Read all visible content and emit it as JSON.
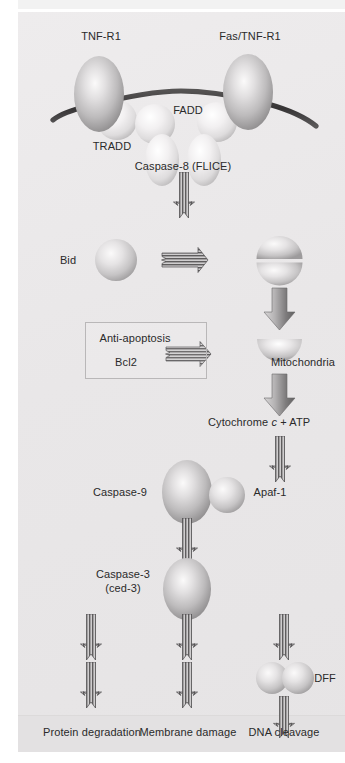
{
  "figure": {
    "background_color": "#eceaea",
    "panel_color": "#e9e7e8",
    "outcome_strip_color": "#e3e1e2"
  },
  "labels": {
    "tnf_r1": "TNF-R1",
    "fas_tnf_r1": "Fas/TNF-R1",
    "tradd": "TRADD",
    "fadd": "FADD",
    "caspase_8": "Caspase-8 (FLICE)",
    "bid": "Bid",
    "mitochondria": "Mitochondria",
    "cytochrome_prefix": "Cytochrome ",
    "cytochrome_italic": "c",
    "cytochrome_suffix": " + ATP",
    "caspase_9": "Caspase-9",
    "apaf_1": "Apaf-1",
    "caspase_3": "Caspase-3",
    "ced_3": "(ced-3)",
    "dff": "DFF",
    "anti_apoptosis": "Anti-apoptosis",
    "bcl2": "Bcl2"
  },
  "outcomes": [
    {
      "label": "Protein degradation"
    },
    {
      "label": "Membrane damage"
    },
    {
      "label": "DNA cleavage"
    }
  ],
  "colors": {
    "membrane": "#3d3d3d",
    "protein_light": "#f0eeee",
    "protein_mid": "#c9c7c8",
    "protein_dark": "#8e8c8d",
    "arrow_striped_dark": "#6f6d6e",
    "arrow_solid_dark": "#5c5a5b",
    "text": "#2a2a2a",
    "box_border": "#b9b7b8"
  },
  "pathway": {
    "nodes": [
      {
        "name": "TNF-R1",
        "shape": "ellipse",
        "role": "receptor"
      },
      {
        "name": "Fas/TNF-R1",
        "shape": "ellipse",
        "role": "receptor"
      },
      {
        "name": "TRADD",
        "shape": "sphere",
        "role": "adaptor"
      },
      {
        "name": "FADD",
        "shape": "sphere",
        "role": "adaptor"
      },
      {
        "name": "Caspase-8 (FLICE)",
        "shape": "ellipse-pair",
        "role": "initiator-caspase"
      },
      {
        "name": "Bid",
        "shape": "sphere",
        "role": "bh3-protein"
      },
      {
        "name": "Mitochondria",
        "shape": "hemisphere",
        "role": "organelle"
      },
      {
        "name": "Cytochrome c + ATP",
        "shape": "text",
        "role": "second-messenger"
      },
      {
        "name": "Caspase-9",
        "shape": "ellipse",
        "role": "initiator-caspase"
      },
      {
        "name": "Apaf-1",
        "shape": "sphere",
        "role": "adaptor"
      },
      {
        "name": "Caspase-3 (ced-3)",
        "shape": "ellipse",
        "role": "effector-caspase"
      },
      {
        "name": "DFF",
        "shape": "sphere-pair",
        "role": "nuclease-factor"
      },
      {
        "name": "Bcl2",
        "shape": "text",
        "role": "anti-apoptotic"
      }
    ],
    "edges": [
      {
        "from": "Caspase-8 (FLICE)",
        "to": "Bid",
        "style": "striped"
      },
      {
        "from": "Bid",
        "to": "truncated-Bid",
        "style": "striped-horizontal"
      },
      {
        "from": "truncated-Bid",
        "to": "Mitochondria",
        "style": "solid"
      },
      {
        "from": "Bcl2",
        "to": "Mitochondria",
        "style": "striped-horizontal-inhibit"
      },
      {
        "from": "Mitochondria",
        "to": "Cytochrome c + ATP",
        "style": "solid"
      },
      {
        "from": "Cytochrome c + ATP",
        "to": "Apaf-1",
        "style": "striped"
      },
      {
        "from": "Caspase-9",
        "to": "Caspase-3 (ced-3)",
        "style": "striped"
      },
      {
        "from": "Caspase-3 (ced-3)",
        "to": "Membrane damage",
        "style": "striped"
      },
      {
        "from": "Caspase-3 (ced-3)",
        "to": "Protein degradation",
        "style": "striped"
      },
      {
        "from": "Caspase-3 (ced-3)",
        "to": "DFF",
        "style": "striped"
      },
      {
        "from": "DFF",
        "to": "DNA cleavage",
        "style": "striped"
      }
    ]
  }
}
